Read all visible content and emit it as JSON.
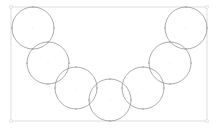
{
  "diagram": {
    "type": "arc-of-circles",
    "colors": {
      "background": "#ffffff",
      "frame": "#d6d6d6",
      "circle": "#8a8a8a",
      "handle": "#9a9a9a"
    },
    "frame": {
      "x": 11,
      "y": 7,
      "width": 196,
      "height": 114
    },
    "circles": [
      {
        "id": "circle-1",
        "cx": 33,
        "cy": 28,
        "r": 21
      },
      {
        "id": "circle-2",
        "cx": 48,
        "cy": 63,
        "r": 21
      },
      {
        "id": "circle-3",
        "cx": 76,
        "cy": 88,
        "r": 21
      },
      {
        "id": "circle-4",
        "cx": 110,
        "cy": 100,
        "r": 21
      },
      {
        "id": "circle-5",
        "cx": 143,
        "cy": 88,
        "r": 21
      },
      {
        "id": "circle-6",
        "cx": 170,
        "cy": 63,
        "r": 21
      },
      {
        "id": "circle-7",
        "cx": 186,
        "cy": 28,
        "r": 21
      }
    ]
  }
}
